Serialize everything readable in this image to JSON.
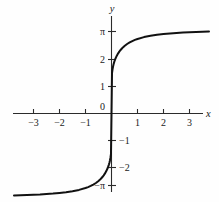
{
  "figure": {
    "background_color": "#fefefe",
    "curve_color": "#111111",
    "axis_color": "#2b2b2b"
  },
  "axis_names": {
    "x": "x",
    "y": "y"
  },
  "x_tick_labels": {
    "n3": "−3",
    "n2": "−2",
    "n1": "−1",
    "p1": "1",
    "p2": "2",
    "p3": "3"
  },
  "y_tick_labels": {
    "pi": "π",
    "p2": "2",
    "p1": "1",
    "zero": "0",
    "n1": "−1",
    "n2": "−2",
    "npi": "−π"
  },
  "chart_data": {
    "type": "line",
    "title": "",
    "xlabel": "x",
    "ylabel": "y",
    "xlim": [
      -3.75,
      3.75
    ],
    "ylim": [
      -3.6,
      3.6
    ],
    "grid": false,
    "legend": null,
    "x_ticks": [
      -3,
      -2,
      -1,
      1,
      2,
      3
    ],
    "x_tick_text": [
      "−3",
      "−2",
      "−1",
      "1",
      "2",
      "3"
    ],
    "y_ticks": [
      3.14159,
      2,
      1,
      0,
      -1,
      -2,
      -3.14159
    ],
    "y_tick_text": [
      "π",
      "2",
      "1",
      "0",
      "−1",
      "−2",
      "−π"
    ],
    "asymptotes": [
      3.14159,
      -3.14159
    ],
    "series": [
      {
        "name": "y = 2 arctan(5x)",
        "x": [
          -3.75,
          -3.5,
          -3.25,
          -3.0,
          -2.75,
          -2.5,
          -2.25,
          -2.0,
          -1.75,
          -1.5,
          -1.25,
          -1.0,
          -0.9,
          -0.8,
          -0.7,
          -0.6,
          -0.5,
          -0.45,
          -0.4,
          -0.35,
          -0.3,
          -0.25,
          -0.2,
          -0.15,
          -0.12,
          -0.1,
          -0.08,
          -0.06,
          -0.04,
          -0.02,
          0.0,
          0.02,
          0.04,
          0.06,
          0.08,
          0.1,
          0.12,
          0.15,
          0.2,
          0.25,
          0.3,
          0.35,
          0.4,
          0.45,
          0.5,
          0.6,
          0.7,
          0.8,
          0.9,
          1.0,
          1.25,
          1.5,
          1.75,
          2.0,
          2.25,
          2.5,
          2.75,
          3.0,
          3.25,
          3.5,
          3.75
        ],
        "y": [
          -3.035,
          -3.028,
          -3.019,
          -3.008,
          -3.0,
          -2.983,
          -2.965,
          -2.942,
          -2.914,
          -2.877,
          -2.83,
          -2.761,
          -2.725,
          -2.683,
          -2.633,
          -2.574,
          -2.5,
          -2.457,
          -2.408,
          -2.353,
          -2.291,
          -2.219,
          -2.133,
          -2.029,
          -1.953,
          -1.893,
          -1.824,
          -1.74,
          -1.635,
          -1.498,
          0.0,
          1.498,
          1.635,
          1.74,
          1.824,
          1.893,
          1.953,
          2.029,
          2.133,
          2.219,
          2.291,
          2.353,
          2.408,
          2.457,
          2.5,
          2.574,
          2.633,
          2.683,
          2.725,
          2.761,
          2.83,
          2.877,
          2.914,
          2.942,
          2.965,
          2.983,
          3.0,
          3.008,
          3.019,
          3.028,
          3.035
        ]
      }
    ]
  }
}
